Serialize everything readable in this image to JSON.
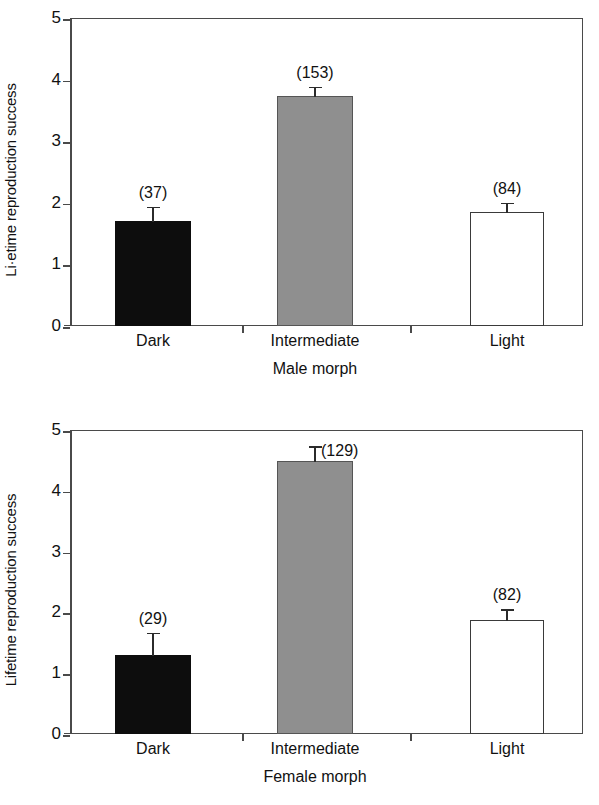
{
  "figure": {
    "background": "#ffffff",
    "panel_count": 2
  },
  "chart_data": [
    {
      "id": "male-panel",
      "type": "bar",
      "title": "",
      "xlabel": "Male morph",
      "ylabel": "Li·etime reproduction success",
      "categories": [
        "Dark",
        "Intermediate",
        "Light"
      ],
      "values": [
        1.7,
        3.73,
        1.85
      ],
      "errors": [
        0.25,
        0.17,
        0.17
      ],
      "annotations": [
        "(37)",
        "(153)",
        "(84)"
      ],
      "sample_sizes": [
        37,
        153,
        84
      ],
      "bar_colors": [
        "#0d0d0d",
        "#8f8f8f",
        "#ffffff"
      ],
      "ylim": [
        0,
        5
      ],
      "yticks": [
        0,
        1,
        2,
        3,
        4,
        5
      ],
      "ytick_labels": [
        "0",
        "1",
        "2",
        "3",
        "4",
        "5"
      ],
      "grid": false,
      "legend": "none"
    },
    {
      "id": "female-panel",
      "type": "bar",
      "title": "",
      "xlabel": "Female morph",
      "ylabel": "Lifetime reproduction success",
      "categories": [
        "Dark",
        "Intermediate",
        "Light"
      ],
      "values": [
        1.3,
        4.49,
        1.87
      ],
      "errors": [
        0.38,
        0.26,
        0.2
      ],
      "annotations": [
        "(29)",
        "(129)",
        "(82)"
      ],
      "sample_sizes": [
        29,
        129,
        82
      ],
      "bar_colors": [
        "#0d0d0d",
        "#8f8f8f",
        "#ffffff"
      ],
      "ylim": [
        0,
        5
      ],
      "yticks": [
        0,
        1,
        2,
        3,
        4,
        5
      ],
      "ytick_labels": [
        "0",
        "1",
        "2",
        "3",
        "4",
        "5"
      ],
      "grid": false,
      "legend": "none"
    }
  ],
  "male": {
    "ylabel": "Li·etime reproduction success",
    "xlabel": "Male morph",
    "yticks": [
      "5",
      "4",
      "3",
      "2",
      "1",
      "0"
    ],
    "bars": [
      {
        "category": "Dark",
        "n_label": "(37)"
      },
      {
        "category": "Intermediate",
        "n_label": "(153)"
      },
      {
        "category": "Light",
        "n_label": "(84)"
      }
    ]
  },
  "female": {
    "ylabel": "Lifetime reproduction success",
    "xlabel": "Female morph",
    "yticks": [
      "5",
      "4",
      "3",
      "2",
      "1",
      "0"
    ],
    "bars": [
      {
        "category": "Dark",
        "n_label": "(29)"
      },
      {
        "category": "Intermediate",
        "n_label": "(129)"
      },
      {
        "category": "Light",
        "n_label": "(82)"
      }
    ]
  }
}
